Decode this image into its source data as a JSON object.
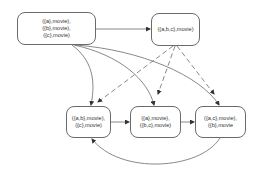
{
  "diagram": {
    "nodes": [
      {
        "id": "n1",
        "lines": [
          "({a},movie),",
          "({b},movie),",
          "({c},movie)"
        ]
      },
      {
        "id": "n2",
        "lines": [
          "({a,b,c},movie)"
        ]
      },
      {
        "id": "n3",
        "lines": [
          "({a,b},movie),",
          "({c},movie)"
        ]
      },
      {
        "id": "n4",
        "lines": [
          "({a},movie),",
          "({b,c},movie)"
        ]
      },
      {
        "id": "n5",
        "lines": [
          "({a,c},movie),",
          "({b},movie"
        ]
      }
    ],
    "edges": [
      {
        "from": "n1",
        "to": "n2",
        "style": "solid"
      },
      {
        "from": "n1",
        "to": "n3",
        "style": "solid"
      },
      {
        "from": "n1",
        "to": "n4",
        "style": "solid"
      },
      {
        "from": "n1",
        "to": "n5",
        "style": "solid"
      },
      {
        "from": "n2",
        "to": "n3",
        "style": "dashed"
      },
      {
        "from": "n2",
        "to": "n4",
        "style": "dashed"
      },
      {
        "from": "n2",
        "to": "n5",
        "style": "dashed"
      },
      {
        "from": "n3",
        "to": "n4",
        "style": "solid"
      },
      {
        "from": "n4",
        "to": "n5",
        "style": "solid"
      },
      {
        "from": "n5",
        "to": "n3",
        "style": "solid"
      }
    ],
    "colors": {
      "stroke": "#6b6b6b",
      "arrow": "#333333",
      "text": "#333333"
    }
  }
}
